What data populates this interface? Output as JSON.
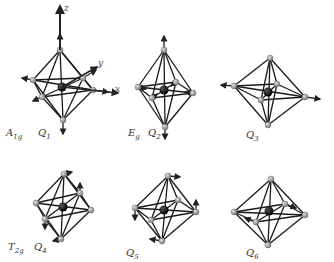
{
  "figure": {
    "axes": {
      "x": "x",
      "y": "y",
      "z": "z"
    },
    "panels": [
      {
        "id": "Q1",
        "irrep": "A",
        "irrep_sub": "1g",
        "mode": "Q",
        "mode_sub": "1",
        "verts": {
          "top": [
            60,
            50
          ],
          "bottom": [
            63,
            120
          ],
          "left": [
            33,
            80
          ],
          "right": [
            93,
            90
          ],
          "back": [
            83,
            78
          ],
          "front": [
            42,
            97
          ]
        },
        "center": [
          62,
          87
        ],
        "arrows": [
          [
            60,
            50,
            60,
            34
          ],
          [
            63,
            120,
            63,
            134
          ],
          [
            33,
            80,
            22,
            78
          ],
          [
            93,
            90,
            108,
            92
          ],
          [
            83,
            78,
            96,
            70
          ],
          [
            42,
            97,
            33,
            101
          ]
        ]
      },
      {
        "id": "Q2",
        "irrep": "E",
        "irrep_sub": "g",
        "mode": "Q",
        "mode_sub": "2",
        "verts": {
          "top": [
            164,
            50
          ],
          "bottom": [
            165,
            127
          ],
          "left": [
            138,
            87
          ],
          "right": [
            193,
            93
          ],
          "back": [
            176,
            82
          ],
          "front": [
            152,
            98
          ]
        },
        "center": [
          164,
          90
        ],
        "arrows": [
          [
            164,
            50,
            164,
            36
          ],
          [
            165,
            127,
            165,
            139
          ],
          [
            138,
            87,
            146,
            89
          ],
          [
            193,
            93,
            185,
            92
          ],
          [
            176,
            82,
            171,
            86
          ],
          [
            152,
            98,
            157,
            94
          ]
        ]
      },
      {
        "id": "Q3",
        "irrep": "",
        "irrep_sub": "",
        "mode": "Q",
        "mode_sub": "3",
        "verts": {
          "top": [
            270,
            58
          ],
          "bottom": [
            268,
            125
          ],
          "left": [
            234,
            86
          ],
          "right": [
            305,
            97
          ],
          "back": [
            277,
            84
          ],
          "front": [
            261,
            100
          ]
        },
        "center": [
          268,
          92
        ],
        "arrows": [
          [
            234,
            86,
            221,
            85
          ],
          [
            305,
            97,
            320,
            99
          ]
        ]
      },
      {
        "id": "Q4",
        "irrep": "T",
        "irrep_sub": "2g",
        "mode": "Q",
        "mode_sub": "4",
        "verts": {
          "top": [
            64,
            174
          ],
          "bottom": [
            61,
            239
          ],
          "left": [
            36,
            203
          ],
          "right": [
            91,
            210
          ],
          "back": [
            80,
            193
          ],
          "front": [
            45,
            219
          ]
        },
        "center": [
          63,
          207
        ],
        "arrows": [
          [
            64,
            174,
            72,
            172
          ],
          [
            61,
            239,
            53,
            241
          ],
          [
            80,
            193,
            80,
            183
          ],
          [
            45,
            219,
            45,
            229
          ]
        ]
      },
      {
        "id": "Q5",
        "irrep": "",
        "irrep_sub": "",
        "mode": "Q",
        "mode_sub": "5",
        "verts": {
          "top": [
            168,
            176
          ],
          "bottom": [
            162,
            241
          ],
          "left": [
            135,
            208
          ],
          "right": [
            196,
            212
          ],
          "back": [
            178,
            200
          ],
          "front": [
            151,
            220
          ]
        },
        "center": [
          164,
          210
        ],
        "arrows": [
          [
            168,
            176,
            180,
            177
          ],
          [
            162,
            241,
            150,
            239
          ],
          [
            196,
            212,
            196,
            200
          ],
          [
            135,
            208,
            135,
            220
          ]
        ]
      },
      {
        "id": "Q6",
        "irrep": "",
        "irrep_sub": "",
        "mode": "Q",
        "mode_sub": "6",
        "verts": {
          "top": [
            271,
            179
          ],
          "bottom": [
            268,
            245
          ],
          "left": [
            234,
            212
          ],
          "right": [
            305,
            215
          ],
          "back": [
            285,
            204
          ],
          "front": [
            256,
            222
          ]
        },
        "center": [
          269,
          211
        ],
        "arrows": [
          [
            285,
            204,
            296,
            208
          ],
          [
            256,
            222,
            245,
            218
          ]
        ]
      }
    ],
    "labels": [
      {
        "key": "a1g",
        "text": "A",
        "sub": "1g",
        "x": 6,
        "y": 128
      },
      {
        "key": "q1",
        "text": "Q",
        "sub": "1",
        "x": 38,
        "y": 128
      },
      {
        "key": "eg",
        "text": "E",
        "sub": "g",
        "x": 128,
        "y": 128
      },
      {
        "key": "q2",
        "text": "Q",
        "sub": "2",
        "x": 148,
        "y": 128
      },
      {
        "key": "q3",
        "text": "Q",
        "sub": "3",
        "x": 246,
        "y": 130
      },
      {
        "key": "t2g",
        "text": "T",
        "sub": "2g",
        "x": 8,
        "y": 242
      },
      {
        "key": "q4",
        "text": "Q",
        "sub": "4",
        "x": 34,
        "y": 242
      },
      {
        "key": "q5",
        "text": "Q",
        "sub": "5",
        "x": 126,
        "y": 248
      },
      {
        "key": "q6",
        "text": "Q",
        "sub": "6",
        "x": 246,
        "y": 248
      }
    ],
    "axis_labels": [
      {
        "text": "z",
        "x": 64,
        "y": 4
      },
      {
        "text": "y",
        "x": 98,
        "y": 59
      },
      {
        "text": "x",
        "x": 115,
        "y": 85
      }
    ],
    "colors": {
      "edge": "#1a1a1a",
      "vertex": "#9a9a9a",
      "center": "#111111",
      "arrow": "#2a2a2a"
    }
  }
}
